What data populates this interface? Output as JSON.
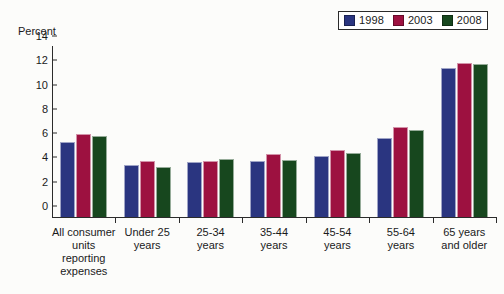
{
  "chart_data": {
    "type": "bar",
    "title": "",
    "xlabel": "",
    "ylabel": "Percent",
    "ylim": [
      0,
      14
    ],
    "yticks": [
      0,
      2,
      4,
      6,
      8,
      10,
      12,
      14
    ],
    "ytick_labels": [
      "0",
      "2",
      "4",
      "6",
      "8",
      "10",
      "12",
      "14"
    ],
    "grid": false,
    "legend_position": "top-right",
    "categories": [
      "All consumer\nunits\nreporting\nexpenses",
      "Under 25\nyears",
      "25-34\nyears",
      "35-44\nyears",
      "45-54\nyears",
      "55-64\nyears",
      "65 years\nand older"
    ],
    "series": [
      {
        "name": "1998",
        "color": "#2a3580",
        "values": [
          6.2,
          4.3,
          4.5,
          4.6,
          5.0,
          6.5,
          12.3
        ]
      },
      {
        "name": "2003",
        "color": "#9d1140",
        "values": [
          6.8,
          4.6,
          4.6,
          5.2,
          5.5,
          7.4,
          12.7
        ]
      },
      {
        "name": "2008",
        "color": "#17471e",
        "values": [
          6.7,
          4.1,
          4.8,
          4.7,
          5.3,
          7.2,
          12.6
        ]
      }
    ]
  },
  "legend": {
    "items": [
      {
        "label": "1998",
        "color": "#2a3580"
      },
      {
        "label": "2003",
        "color": "#9d1140"
      },
      {
        "label": "2008",
        "color": "#17471e"
      }
    ]
  },
  "axis": {
    "y_title": "Percent"
  },
  "colors": {
    "series_1998": "#2a3580",
    "series_2003": "#9d1140",
    "series_2008": "#17471e",
    "axis": "#2b2b2b",
    "background": "#fcfcfa"
  }
}
